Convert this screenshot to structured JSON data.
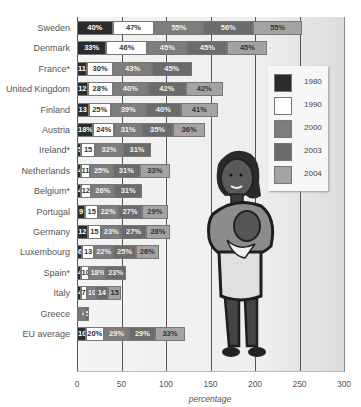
{
  "chart_data": {
    "type": "bar",
    "orientation": "horizontal",
    "stacked": true,
    "title": "",
    "xlabel": "percentage",
    "ylabel": "",
    "xlim": [
      0,
      300
    ],
    "xticks": [
      0,
      50,
      100,
      150,
      200,
      250,
      300
    ],
    "grid": true,
    "legend_position": "right, inset",
    "categories": [
      "Sweden",
      "Denmark",
      "France*",
      "United Kingdom",
      "Finland",
      "Austria",
      "Ireland*",
      "Netherlands",
      "Belgium*",
      "Portugal",
      "Germany",
      "Luxembourg",
      "Spain*",
      "Italy",
      "Greece",
      "EU average"
    ],
    "series": [
      {
        "name": "1980",
        "color": "#2b2b2b",
        "values": [
          40,
          33,
          11,
          12,
          13,
          18,
          5,
          4,
          4,
          9,
          12,
          6,
          4,
          4,
          1,
          10
        ],
        "labels": [
          "40%",
          "33%",
          "11",
          "12",
          "13",
          "18%",
          "5",
          "4",
          "4",
          "9",
          "12",
          "6",
          "4",
          "4",
          "",
          "10"
        ]
      },
      {
        "name": "1990",
        "color": "#ffffff",
        "values": [
          47,
          46,
          30,
          28,
          25,
          24,
          15,
          11,
          12,
          15,
          15,
          13,
          10,
          7,
          2,
          20
        ],
        "labels": [
          "47%",
          "46%",
          "30%",
          "28%",
          "25%",
          "24%",
          "15",
          "11",
          "12",
          "15",
          "15",
          "13",
          "10",
          "7",
          "",
          "20%"
        ]
      },
      {
        "name": "2000",
        "color": "#7d7d7d",
        "values": [
          55,
          45,
          43,
          40,
          39,
          31,
          32,
          25,
          26,
          22,
          23,
          22,
          18,
          10,
          4,
          29
        ],
        "labels": [
          "55%",
          "45%",
          "43%",
          "40%",
          "39%",
          "31%",
          "32%",
          "25%",
          "26%",
          "22%",
          "23%",
          "22%",
          "18%",
          "10",
          "4",
          "29%"
        ]
      },
      {
        "name": "2003",
        "color": "#6b6b6b",
        "values": [
          56,
          45,
          45,
          42,
          40,
          35,
          31,
          31,
          31,
          27,
          27,
          25,
          23,
          14,
          5,
          29
        ],
        "labels": [
          "56%",
          "45%",
          "45%",
          "42%",
          "40%",
          "35%",
          "31%",
          "31%",
          "31%",
          "27%",
          "27%",
          "25%",
          "23%",
          "14",
          "5",
          "29%"
        ]
      },
      {
        "name": "2004",
        "color": "#a3a3a3",
        "values": [
          55,
          45,
          0,
          42,
          41,
          36,
          0,
          33,
          0,
          29,
          28,
          26,
          0,
          15,
          0,
          33
        ],
        "labels": [
          "55%",
          "45%",
          "",
          "42%",
          "41%",
          "36%",
          "",
          "33%",
          "",
          "29%",
          "28%",
          "26%",
          "",
          "15",
          "",
          "33%"
        ]
      }
    ],
    "annotations": [
      "Illustration: woman holding a baby"
    ]
  },
  "legend": {
    "items": [
      {
        "label": "1980",
        "color": "#2b2b2b"
      },
      {
        "label": "1990",
        "color": "#ffffff"
      },
      {
        "label": "2000",
        "color": "#7d7d7d"
      },
      {
        "label": "2003",
        "color": "#6b6b6b"
      },
      {
        "label": "2004",
        "color": "#a3a3a3"
      }
    ]
  },
  "axis": {
    "xlabel": "percentage",
    "ticks": [
      "0",
      "50",
      "100",
      "150",
      "200",
      "250",
      "300"
    ]
  }
}
